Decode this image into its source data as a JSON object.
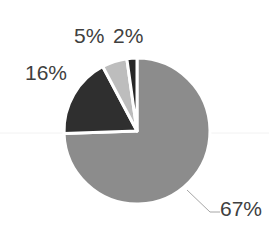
{
  "chart_data": {
    "type": "pie",
    "title": "",
    "start_angle_deg": 0,
    "direction": "clockwise",
    "slices": [
      {
        "label": "67%",
        "value": 67,
        "color": "#8c8c8c"
      },
      {
        "label": "16%",
        "value": 16,
        "color": "#2f2f2f"
      },
      {
        "label": "5%",
        "value": 5,
        "color": "#bdbdbd"
      },
      {
        "label": "2%",
        "value": 2,
        "color": "#262626"
      }
    ],
    "data_labels": [
      "67%",
      "16%",
      "5%",
      "2%"
    ],
    "legend": "none"
  },
  "labels": {
    "l67": "67%",
    "l16": "16%",
    "l5": "5%",
    "l2": "2%"
  }
}
